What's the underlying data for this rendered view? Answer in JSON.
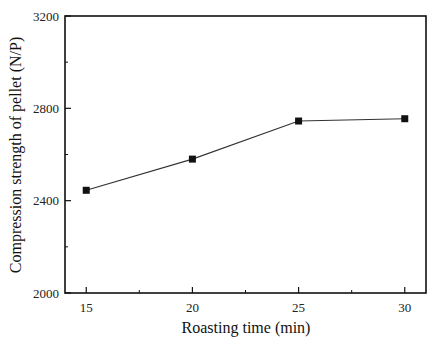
{
  "chart_data": {
    "type": "line",
    "title": "",
    "xlabel": "Roasting time (min)",
    "ylabel": "Compression strength of pellet (N/P)",
    "x": [
      15,
      20,
      25,
      30
    ],
    "series": [
      {
        "name": "Compression strength",
        "values": [
          2445,
          2580,
          2745,
          2755
        ],
        "marker": "square",
        "color": "#111111"
      }
    ],
    "xlim": [
      14,
      31
    ],
    "ylim": [
      2000,
      3200
    ],
    "xticks": [
      15,
      20,
      25,
      30
    ],
    "xticks_minor": [
      17.5,
      22.5,
      27.5
    ],
    "yticks": [
      2000,
      2400,
      2800,
      3200
    ],
    "yticks_minor": [
      2200,
      2600,
      3000
    ],
    "grid": false,
    "legend": null
  },
  "labels": {
    "xlabel": "Roasting time (min)",
    "ylabel": "Compression strength of pellet (N/P)"
  }
}
